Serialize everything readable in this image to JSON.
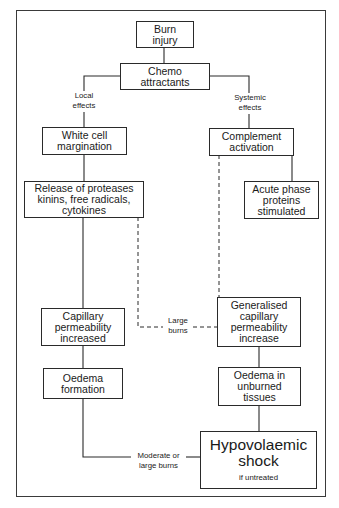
{
  "diagram": {
    "nodes": {
      "burn_injury": {
        "lines": [
          "Burn",
          "injury"
        ]
      },
      "chemo_attractants": {
        "lines": [
          "Chemo",
          "attractants"
        ]
      },
      "white_cell_margination": {
        "lines": [
          "White cell",
          "margination"
        ]
      },
      "complement_activation": {
        "lines": [
          "Complement",
          "activation"
        ]
      },
      "release_of_proteases": {
        "lines": [
          "Release of proteases",
          "kinins, free radicals,",
          "cytokines"
        ]
      },
      "acute_phase_proteins": {
        "lines": [
          "Acute phase",
          "proteins",
          "stimulated"
        ]
      },
      "capillary_permeability_increased": {
        "lines": [
          "Capillary",
          "permeability",
          "increased"
        ]
      },
      "generalised_capillary_permeability": {
        "lines": [
          "Generalised",
          "capillary",
          "permeability",
          "increase"
        ]
      },
      "oedema_formation": {
        "lines": [
          "Oedema",
          "formation"
        ]
      },
      "oedema_unburned": {
        "lines": [
          "Oedema in",
          "unburned",
          "tissues"
        ]
      },
      "hypovolaemic_shock": {
        "title_lines": [
          "Hypovolaemic",
          "shock"
        ],
        "subtitle": "if untreated"
      }
    },
    "edge_labels": {
      "local_effects": [
        "Local",
        "effects"
      ],
      "systemic_effects": [
        "Systemic",
        "effects"
      ],
      "large_burns": [
        "Large",
        "burns"
      ],
      "moderate_or_large_burns": [
        "Moderate or",
        "large burns"
      ]
    },
    "colors": {
      "line": "#2a2a2a",
      "background": "#ffffff",
      "text": "#1a1a1a"
    }
  }
}
